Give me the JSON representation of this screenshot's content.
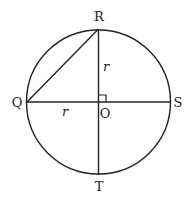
{
  "diagram": {
    "type": "geometry",
    "points": {
      "R": {
        "label": "R",
        "x": 99,
        "y": 29
      },
      "Q": {
        "label": "Q",
        "x": 28,
        "y": 102
      },
      "O": {
        "label": "O",
        "x": 99,
        "y": 102
      },
      "S": {
        "label": "S",
        "x": 169,
        "y": 102
      },
      "T": {
        "label": "T",
        "x": 99,
        "y": 175
      }
    },
    "circle": {
      "cx": 98.5,
      "cy": 102,
      "r": 72
    },
    "segments": [
      {
        "from": "Q",
        "to": "S"
      },
      {
        "from": "R",
        "to": "T"
      },
      {
        "from": "Q",
        "to": "R"
      }
    ],
    "right_angle_marker": {
      "at": "O",
      "between": [
        "O-R",
        "O-S"
      ]
    },
    "radius_labels": [
      {
        "text": "r",
        "segment": "O-R"
      },
      {
        "text": "r",
        "segment": "Q-O"
      }
    ],
    "colors": {
      "stroke": "#222222",
      "background": "#ffffff"
    }
  }
}
